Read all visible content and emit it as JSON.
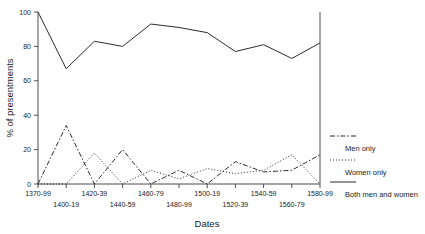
{
  "chart_data": {
    "type": "line",
    "title": "",
    "xlabel": "Dates",
    "ylabel": "% of presentments",
    "ylim": [
      0,
      100
    ],
    "yticks": [
      0,
      20,
      40,
      60,
      80,
      100
    ],
    "grid": false,
    "legend_position": "right-outside",
    "categories": [
      "1370-99",
      "1400-19",
      "1420-39",
      "1440-59",
      "1460-79",
      "1480-99",
      "1500-19",
      "1520-39",
      "1540-59",
      "1560-79",
      "1580-99"
    ],
    "series": [
      {
        "name": "Men only",
        "style": "dash-dot",
        "values": [
          0,
          34,
          0,
          20,
          0,
          8,
          0,
          13,
          7,
          8,
          17
        ]
      },
      {
        "name": "Women only",
        "style": "dotted",
        "values": [
          0,
          0,
          18,
          0,
          8,
          3,
          9,
          6,
          8,
          17,
          0
        ]
      },
      {
        "name": "Both men and women",
        "style": "solid",
        "values": [
          100,
          67,
          83,
          80,
          93,
          91,
          88,
          77,
          81,
          73,
          82
        ]
      }
    ]
  },
  "axes": {
    "y_title": "% of presentments",
    "x_title": "Dates",
    "y_tick_labels": [
      "0",
      "20",
      "40",
      "60",
      "80",
      "100"
    ],
    "x_tick_labels_row1": [
      "1370-99",
      "1420-39",
      "1460-79",
      "1500-19",
      "1540-59",
      "1580-99"
    ],
    "x_tick_labels_row2": [
      "1400-19",
      "1440-59",
      "1480-99",
      "1520-39",
      "1560-79"
    ]
  },
  "legend": {
    "entries": [
      {
        "label": "Men only",
        "style": "dash-dot"
      },
      {
        "label": "Women only",
        "style": "dotted"
      },
      {
        "label": "Both men and women",
        "style": "solid"
      }
    ]
  },
  "colors": {
    "line": "#2b2b2b",
    "axis": "#4d4d4d",
    "text": "#1a1a1a",
    "background": "#ffffff"
  }
}
